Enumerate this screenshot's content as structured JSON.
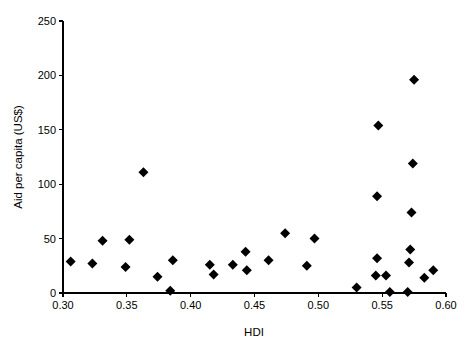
{
  "chart_data": {
    "type": "scatter",
    "title": "",
    "xlabel": "HDI",
    "ylabel": "Aid per capita (US$)",
    "xlim": [
      0.3,
      0.6
    ],
    "ylim": [
      0,
      250
    ],
    "xticks": [
      0.3,
      0.35,
      0.4,
      0.45,
      0.5,
      0.55,
      0.6
    ],
    "xtick_labels": [
      "0.30",
      "0.35",
      "0.40",
      "0.45",
      "0.50",
      "0.55",
      "0.60"
    ],
    "yticks": [
      0,
      50,
      100,
      150,
      200,
      250
    ],
    "ytick_labels": [
      "0",
      "50",
      "100",
      "150",
      "200",
      "250"
    ],
    "grid": false,
    "legend": false,
    "marker": "diamond",
    "marker_color": "#000000",
    "marker_size": 7,
    "series": [
      {
        "name": "Countries",
        "points": [
          {
            "x": 0.306,
            "y": 29
          },
          {
            "x": 0.323,
            "y": 27
          },
          {
            "x": 0.331,
            "y": 48
          },
          {
            "x": 0.349,
            "y": 24
          },
          {
            "x": 0.352,
            "y": 49
          },
          {
            "x": 0.363,
            "y": 111
          },
          {
            "x": 0.374,
            "y": 15
          },
          {
            "x": 0.384,
            "y": 2
          },
          {
            "x": 0.386,
            "y": 30
          },
          {
            "x": 0.415,
            "y": 26
          },
          {
            "x": 0.418,
            "y": 17
          },
          {
            "x": 0.433,
            "y": 26
          },
          {
            "x": 0.443,
            "y": 38
          },
          {
            "x": 0.444,
            "y": 21
          },
          {
            "x": 0.461,
            "y": 30
          },
          {
            "x": 0.474,
            "y": 55
          },
          {
            "x": 0.491,
            "y": 25
          },
          {
            "x": 0.497,
            "y": 50
          },
          {
            "x": 0.53,
            "y": 5
          },
          {
            "x": 0.545,
            "y": 16
          },
          {
            "x": 0.546,
            "y": 32
          },
          {
            "x": 0.546,
            "y": 89
          },
          {
            "x": 0.547,
            "y": 154
          },
          {
            "x": 0.553,
            "y": 16
          },
          {
            "x": 0.556,
            "y": 1
          },
          {
            "x": 0.57,
            "y": 1
          },
          {
            "x": 0.571,
            "y": 28
          },
          {
            "x": 0.572,
            "y": 40
          },
          {
            "x": 0.573,
            "y": 74
          },
          {
            "x": 0.574,
            "y": 119
          },
          {
            "x": 0.575,
            "y": 196
          },
          {
            "x": 0.583,
            "y": 14
          },
          {
            "x": 0.59,
            "y": 21
          }
        ]
      }
    ]
  },
  "layout": {
    "plot_left_px": 63,
    "plot_right_px": 446,
    "plot_bottom_px": 293,
    "plot_top_px": 21
  }
}
